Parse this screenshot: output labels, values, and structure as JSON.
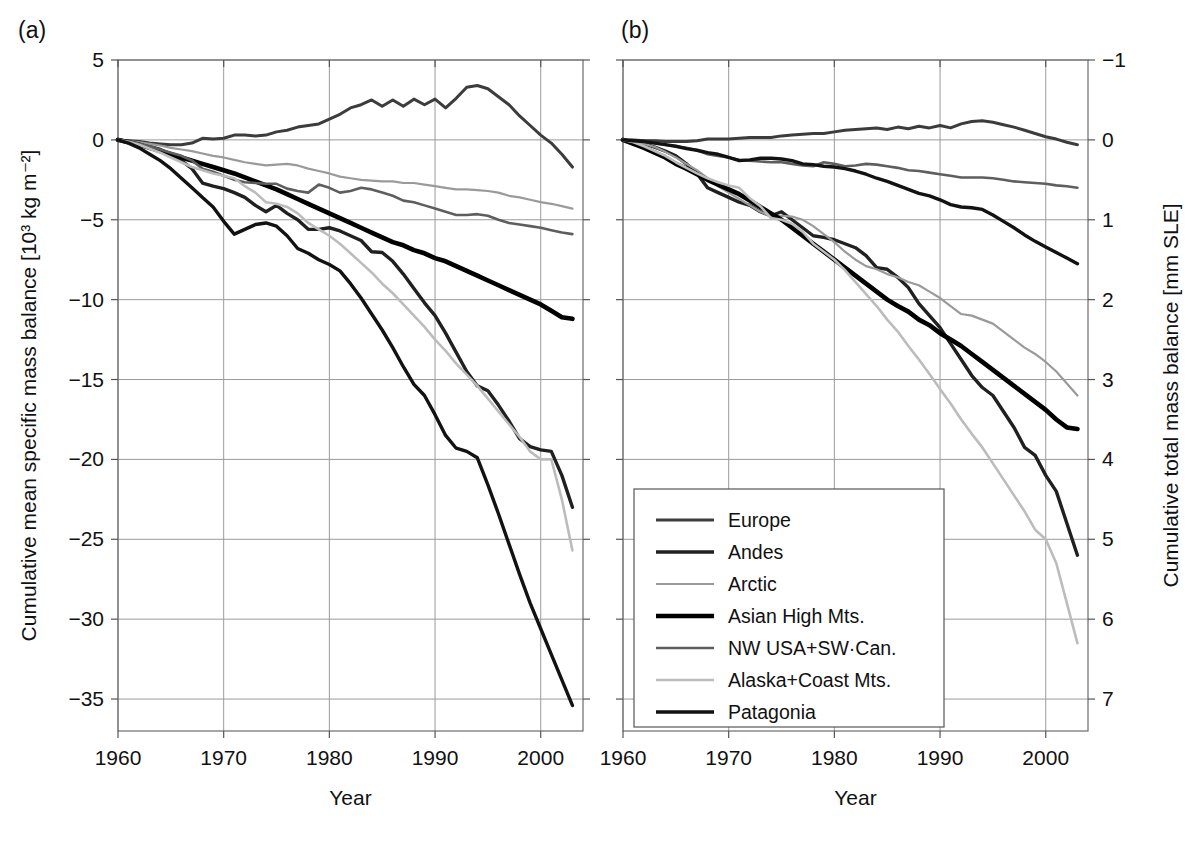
{
  "figure": {
    "panels": [
      {
        "id": "a",
        "label": "(a)"
      },
      {
        "id": "b",
        "label": "(b)"
      }
    ],
    "xlabel": "Year",
    "left_axis_title": "Cumulative mean specific mass balance [10³ kg m⁻²]",
    "right_axis_title": "Cumulative total mass balance [mm SLE]"
  },
  "legend": {
    "entries": [
      {
        "label": "Europe",
        "color": "#3c3c3c",
        "width": 3.0
      },
      {
        "label": "Andes",
        "color": "#202020",
        "width": 3.4
      },
      {
        "label": "Arctic",
        "color": "#9a9a9a",
        "width": 2.2
      },
      {
        "label": "Asian High Mts.",
        "color": "#000000",
        "width": 4.6
      },
      {
        "label": "NW USA+SW·Can.",
        "color": "#5e5e5e",
        "width": 2.6
      },
      {
        "label": "Alaska+Coast Mts.",
        "color": "#bcbcbc",
        "width": 2.6
      },
      {
        "label": "Patagonia",
        "color": "#121212",
        "width": 3.4
      }
    ]
  },
  "chart_data": [
    {
      "type": "line",
      "panel": "a",
      "title": "(a)",
      "xlabel": "Year",
      "ylabel": "Cumulative mean specific mass balance [10³ kg m⁻²]",
      "xlim": [
        1960,
        2004
      ],
      "ylim": [
        -37,
        5
      ],
      "xticks": [
        1960,
        1970,
        1980,
        1990,
        2000
      ],
      "yticks": [
        5,
        0,
        -5,
        -10,
        -15,
        -20,
        -25,
        -30,
        -35
      ],
      "grid": true,
      "legend_position": "bottom-center-between-panels",
      "x": [
        1960,
        1961,
        1962,
        1963,
        1964,
        1965,
        1966,
        1967,
        1968,
        1969,
        1970,
        1971,
        1972,
        1973,
        1974,
        1975,
        1976,
        1977,
        1978,
        1979,
        1980,
        1981,
        1982,
        1983,
        1984,
        1985,
        1986,
        1987,
        1988,
        1989,
        1990,
        1991,
        1992,
        1993,
        1994,
        1995,
        1996,
        1997,
        1998,
        1999,
        2000,
        2001,
        2002,
        2003
      ],
      "series": [
        {
          "name": "Europe",
          "values": [
            0,
            -0.05,
            -0.1,
            -0.2,
            -0.25,
            -0.3,
            -0.3,
            -0.2,
            0.1,
            0.05,
            0.1,
            0.3,
            0.3,
            0.25,
            0.3,
            0.5,
            0.6,
            0.8,
            0.9,
            1.0,
            1.3,
            1.6,
            2.0,
            2.2,
            2.5,
            2.1,
            2.5,
            2.1,
            2.55,
            2.2,
            2.55,
            2.0,
            2.6,
            3.3,
            3.4,
            3.2,
            2.7,
            2.2,
            1.5,
            0.9,
            0.3,
            -0.2,
            -0.9,
            -1.7
          ]
        },
        {
          "name": "Andes",
          "values": [
            0,
            -0.1,
            -0.25,
            -0.4,
            -0.6,
            -0.9,
            -1.3,
            -1.8,
            -2.7,
            -2.9,
            -3.05,
            -3.3,
            -3.6,
            -4.1,
            -4.5,
            -4.1,
            -4.6,
            -5.0,
            -5.6,
            -5.6,
            -5.5,
            -5.7,
            -6.0,
            -6.3,
            -7.0,
            -7.05,
            -7.6,
            -8.4,
            -9.3,
            -10.2,
            -11.0,
            -12.1,
            -13.3,
            -14.5,
            -15.4,
            -15.7,
            -16.6,
            -17.6,
            -18.7,
            -19.2,
            -19.4,
            -19.5,
            -21.0,
            -23.0
          ]
        },
        {
          "name": "Arctic",
          "values": [
            0,
            -0.08,
            -0.15,
            -0.25,
            -0.35,
            -0.5,
            -0.6,
            -0.7,
            -0.85,
            -1.0,
            -1.1,
            -1.25,
            -1.4,
            -1.5,
            -1.6,
            -1.55,
            -1.5,
            -1.6,
            -1.8,
            -1.95,
            -2.1,
            -2.3,
            -2.4,
            -2.5,
            -2.55,
            -2.6,
            -2.6,
            -2.7,
            -2.7,
            -2.8,
            -2.9,
            -3.0,
            -3.1,
            -3.1,
            -3.15,
            -3.2,
            -3.3,
            -3.5,
            -3.6,
            -3.75,
            -3.9,
            -4.0,
            -4.15,
            -4.3
          ]
        },
        {
          "name": "Asian High Mts.",
          "values": [
            0,
            -0.15,
            -0.3,
            -0.5,
            -0.7,
            -0.9,
            -1.1,
            -1.3,
            -1.5,
            -1.7,
            -1.9,
            -2.1,
            -2.35,
            -2.6,
            -2.85,
            -3.1,
            -3.4,
            -3.7,
            -4.0,
            -4.3,
            -4.6,
            -4.9,
            -5.2,
            -5.5,
            -5.8,
            -6.1,
            -6.4,
            -6.6,
            -6.9,
            -7.1,
            -7.4,
            -7.6,
            -7.9,
            -8.2,
            -8.5,
            -8.8,
            -9.1,
            -9.4,
            -9.7,
            -10.0,
            -10.3,
            -10.7,
            -11.1,
            -11.2
          ]
        },
        {
          "name": "NW USA+SW·Can.",
          "values": [
            0,
            -0.1,
            -0.25,
            -0.4,
            -0.6,
            -0.8,
            -1.0,
            -1.3,
            -1.8,
            -2.0,
            -2.25,
            -2.5,
            -2.65,
            -2.7,
            -2.75,
            -2.75,
            -3.05,
            -3.2,
            -3.3,
            -2.8,
            -3.0,
            -3.3,
            -3.2,
            -3.0,
            -3.1,
            -3.3,
            -3.5,
            -3.8,
            -3.9,
            -4.1,
            -4.3,
            -4.5,
            -4.7,
            -4.7,
            -4.65,
            -4.75,
            -5.0,
            -5.2,
            -5.3,
            -5.4,
            -5.5,
            -5.65,
            -5.8,
            -5.9
          ]
        },
        {
          "name": "Alaska+Coast Mts.",
          "values": [
            0,
            -0.12,
            -0.3,
            -0.55,
            -0.8,
            -1.1,
            -1.4,
            -1.7,
            -1.9,
            -2.1,
            -2.25,
            -2.4,
            -2.9,
            -3.3,
            -3.9,
            -4.0,
            -4.2,
            -4.6,
            -5.2,
            -5.6,
            -6.0,
            -6.5,
            -7.1,
            -7.7,
            -8.3,
            -9.0,
            -9.6,
            -10.3,
            -11.0,
            -11.7,
            -12.5,
            -13.2,
            -14.0,
            -14.7,
            -15.4,
            -16.2,
            -17.0,
            -17.8,
            -18.6,
            -19.5,
            -20.0,
            -20.0,
            -22.5,
            -25.7
          ]
        },
        {
          "name": "Patagonia",
          "values": [
            0,
            -0.2,
            -0.5,
            -0.9,
            -1.3,
            -1.8,
            -2.4,
            -3.0,
            -3.6,
            -4.2,
            -5.1,
            -5.9,
            -5.6,
            -5.3,
            -5.2,
            -5.4,
            -6.0,
            -6.8,
            -7.1,
            -7.5,
            -7.8,
            -8.2,
            -9.0,
            -9.9,
            -10.9,
            -11.9,
            -13.0,
            -14.2,
            -15.3,
            -16.0,
            -17.2,
            -18.5,
            -19.3,
            -19.5,
            -19.9,
            -21.6,
            -23.4,
            -25.3,
            -27.2,
            -29.0,
            -30.6,
            -32.2,
            -33.8,
            -35.4
          ]
        }
      ]
    },
    {
      "type": "line",
      "panel": "b",
      "title": "(b)",
      "xlabel": "Year",
      "ylabel": "Cumulative total mass balance [mm SLE]",
      "xlim": [
        1960,
        2004
      ],
      "ylim": [
        -1,
        7.4
      ],
      "y_axis_inverted": true,
      "xticks": [
        1960,
        1970,
        1980,
        1990,
        2000
      ],
      "yticks": [
        -1,
        0,
        1,
        2,
        3,
        4,
        5,
        6,
        7
      ],
      "grid": true,
      "legend_position": "bottom-center-between-panels",
      "x": [
        1960,
        1961,
        1962,
        1963,
        1964,
        1965,
        1966,
        1967,
        1968,
        1969,
        1970,
        1971,
        1972,
        1973,
        1974,
        1975,
        1976,
        1977,
        1978,
        1979,
        1980,
        1981,
        1982,
        1983,
        1984,
        1985,
        1986,
        1987,
        1988,
        1989,
        1990,
        1991,
        1992,
        1993,
        1994,
        1995,
        1996,
        1997,
        1998,
        1999,
        2000,
        2001,
        2002,
        2003
      ],
      "series": [
        {
          "name": "Europe",
          "values": [
            0,
            0.0,
            0.01,
            0.01,
            0.02,
            0.02,
            0.02,
            0.01,
            -0.01,
            -0.01,
            -0.01,
            -0.02,
            -0.03,
            -0.03,
            -0.03,
            -0.05,
            -0.06,
            -0.07,
            -0.08,
            -0.08,
            -0.1,
            -0.12,
            -0.13,
            -0.14,
            -0.15,
            -0.13,
            -0.16,
            -0.14,
            -0.17,
            -0.15,
            -0.18,
            -0.15,
            -0.2,
            -0.23,
            -0.24,
            -0.22,
            -0.19,
            -0.16,
            -0.12,
            -0.08,
            -0.04,
            -0.01,
            0.03,
            0.06
          ]
        },
        {
          "name": "Andes",
          "values": [
            0,
            0.02,
            0.05,
            0.09,
            0.14,
            0.2,
            0.3,
            0.42,
            0.6,
            0.66,
            0.72,
            0.78,
            0.82,
            0.9,
            0.95,
            0.9,
            1.0,
            1.1,
            1.2,
            1.22,
            1.25,
            1.3,
            1.35,
            1.45,
            1.6,
            1.62,
            1.72,
            1.85,
            2.05,
            2.2,
            2.35,
            2.55,
            2.75,
            2.95,
            3.1,
            3.2,
            3.4,
            3.6,
            3.85,
            3.95,
            4.2,
            4.4,
            4.8,
            5.2
          ]
        },
        {
          "name": "Arctic",
          "values": [
            0,
            0.02,
            0.05,
            0.09,
            0.15,
            0.22,
            0.3,
            0.38,
            0.48,
            0.58,
            0.66,
            0.74,
            0.82,
            0.9,
            0.96,
            0.95,
            0.96,
            1.0,
            1.08,
            1.18,
            1.28,
            1.4,
            1.5,
            1.58,
            1.62,
            1.68,
            1.72,
            1.78,
            1.82,
            1.9,
            1.98,
            2.08,
            2.18,
            2.2,
            2.25,
            2.3,
            2.4,
            2.5,
            2.6,
            2.68,
            2.78,
            2.9,
            3.05,
            3.2
          ]
        },
        {
          "name": "Asian High Mts.",
          "values": [
            0,
            0.05,
            0.1,
            0.16,
            0.22,
            0.3,
            0.36,
            0.43,
            0.5,
            0.56,
            0.62,
            0.68,
            0.76,
            0.84,
            0.92,
            1.0,
            1.1,
            1.2,
            1.3,
            1.4,
            1.5,
            1.6,
            1.7,
            1.8,
            1.9,
            2.0,
            2.08,
            2.15,
            2.25,
            2.32,
            2.42,
            2.5,
            2.58,
            2.68,
            2.78,
            2.88,
            2.98,
            3.08,
            3.18,
            3.28,
            3.38,
            3.5,
            3.6,
            3.62
          ]
        },
        {
          "name": "NW USA+SW·Can.",
          "values": [
            0,
            0.01,
            0.02,
            0.04,
            0.06,
            0.08,
            0.1,
            0.13,
            0.18,
            0.2,
            0.22,
            0.25,
            0.26,
            0.27,
            0.28,
            0.28,
            0.3,
            0.32,
            0.33,
            0.28,
            0.3,
            0.33,
            0.32,
            0.3,
            0.31,
            0.33,
            0.35,
            0.38,
            0.39,
            0.41,
            0.43,
            0.45,
            0.47,
            0.47,
            0.47,
            0.48,
            0.5,
            0.52,
            0.53,
            0.54,
            0.55,
            0.57,
            0.58,
            0.6
          ]
        },
        {
          "name": "Alaska+Coast Mts.",
          "values": [
            0,
            0.03,
            0.08,
            0.14,
            0.2,
            0.28,
            0.35,
            0.42,
            0.48,
            0.53,
            0.57,
            0.6,
            0.73,
            0.83,
            0.98,
            1.0,
            1.05,
            1.15,
            1.3,
            1.4,
            1.5,
            1.63,
            1.78,
            1.93,
            2.08,
            2.25,
            2.4,
            2.58,
            2.75,
            2.93,
            3.12,
            3.3,
            3.5,
            3.68,
            3.85,
            4.05,
            4.25,
            4.45,
            4.65,
            4.88,
            5.0,
            5.3,
            5.8,
            6.3
          ]
        },
        {
          "name": "Patagonia",
          "values": [
            0,
            0.01,
            0.02,
            0.04,
            0.06,
            0.08,
            0.11,
            0.13,
            0.16,
            0.18,
            0.22,
            0.26,
            0.25,
            0.23,
            0.23,
            0.24,
            0.26,
            0.3,
            0.31,
            0.33,
            0.34,
            0.36,
            0.39,
            0.43,
            0.48,
            0.52,
            0.57,
            0.62,
            0.67,
            0.7,
            0.75,
            0.81,
            0.84,
            0.85,
            0.87,
            0.94,
            1.02,
            1.1,
            1.19,
            1.27,
            1.34,
            1.41,
            1.48,
            1.55
          ]
        }
      ]
    }
  ]
}
